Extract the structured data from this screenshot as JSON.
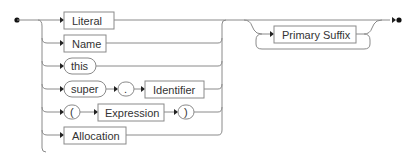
{
  "diagram": {
    "type": "railroad-syntax-diagram",
    "alternatives": [
      {
        "kind": "nonterminal",
        "label": "Literal"
      },
      {
        "kind": "nonterminal",
        "label": "Name"
      },
      {
        "kind": "terminal",
        "label": "this"
      },
      {
        "kind": "sequence",
        "items": [
          {
            "kind": "terminal",
            "label": "super"
          },
          {
            "kind": "terminal",
            "label": "."
          },
          {
            "kind": "nonterminal",
            "label": "Identifier"
          }
        ]
      },
      {
        "kind": "sequence",
        "items": [
          {
            "kind": "terminal",
            "label": "("
          },
          {
            "kind": "nonterminal",
            "label": "Expression"
          },
          {
            "kind": "terminal",
            "label": ")"
          }
        ]
      },
      {
        "kind": "nonterminal",
        "label": "Allocation"
      }
    ],
    "repeat": {
      "kind": "nonterminal",
      "label": "Primary Suffix",
      "loop": "zero-or-more"
    }
  },
  "labels": {
    "literal": "Literal",
    "name": "Name",
    "this": "this",
    "super": "super",
    "dot": ".",
    "identifier": "Identifier",
    "lparen": "(",
    "expression": "Expression",
    "rparen": ")",
    "allocation": "Allocation",
    "primary_suffix": "Primary Suffix"
  }
}
